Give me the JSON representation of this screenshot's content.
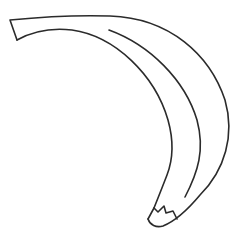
{
  "illustration": {
    "subject": "banana",
    "style": "line-art",
    "stroke_color": "#2b2b2b",
    "background_color": "#ffffff",
    "stroke_width": 1.6
  }
}
